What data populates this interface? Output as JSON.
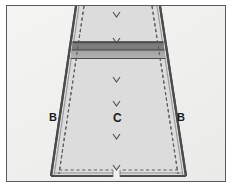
{
  "figure": {
    "type": "technical-pattern-diagram",
    "width": 232,
    "height": 188,
    "background_color": "#ffffff",
    "frame": {
      "border_color": "#5a5a5a",
      "fill_color": "#f1f1f0"
    }
  },
  "panel": {
    "name": "trapezoid-panel",
    "description": "tapered panel, wide at top, narrow at bottom",
    "outline_color": "#4a4a4a",
    "fill_color": "#dedede",
    "seam_line_color": "#6e6e6e",
    "seam_line_style": "dashed"
  },
  "band": {
    "name": "horizontal-band",
    "fill_color": "#7d7d7d",
    "secondary_fill_color": "#a8a8a8",
    "edge_color": "#3b3b3b"
  },
  "notch": {
    "name": "bottom-center-notch",
    "color": "#ffffff"
  },
  "labels": {
    "b_left": "B",
    "b_right": "B",
    "center": "C"
  },
  "direction_marks": {
    "glyph": "chevron-down",
    "color": "#4f4f4f",
    "count": 6,
    "positions_y": [
      14,
      40,
      79,
      103,
      136,
      167
    ]
  },
  "colors": {
    "frame_border": "#5a5a5a",
    "panel_fill": "#dedede",
    "panel_outline": "#4a4a4a",
    "band_dark": "#7d7d7d",
    "band_light": "#a8a8a8",
    "text": "#1d1d1d",
    "page_background": "#ffffff"
  }
}
